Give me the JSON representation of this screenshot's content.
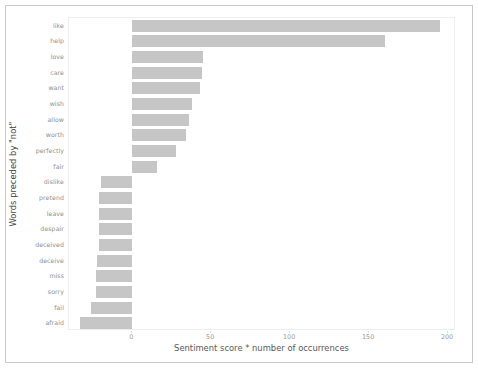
{
  "figure": {
    "ylabel": "Words preceded by \"not\"",
    "xlabel": "Sentiment score * number of occurrences",
    "bar_color": "#c6c6c6",
    "frame_color": "#c9c9c9"
  },
  "chart_data": {
    "type": "bar",
    "orientation": "horizontal",
    "title": "",
    "xlabel": "Sentiment score * number of occurrences",
    "ylabel": "Words preceded by \"not\"",
    "xlim": [
      -40,
      205
    ],
    "xticks": [
      0,
      50,
      100,
      150,
      200
    ],
    "xtick_labels": [
      "0",
      "50",
      "100",
      "150",
      "200"
    ],
    "grid": false,
    "legend": null,
    "categories": [
      "like",
      "help",
      "love",
      "care",
      "want",
      "wish",
      "allow",
      "worth",
      "perfectly",
      "fair",
      "dislike",
      "pretend",
      "leave",
      "despair",
      "deceived",
      "deceive",
      "miss",
      "sorry",
      "fail",
      "afraid"
    ],
    "values": [
      195,
      160,
      45,
      44,
      43,
      38,
      36,
      34,
      28,
      16,
      -20,
      -21,
      -21,
      -21,
      -21,
      -22,
      -23,
      -23,
      -26,
      -33
    ]
  }
}
